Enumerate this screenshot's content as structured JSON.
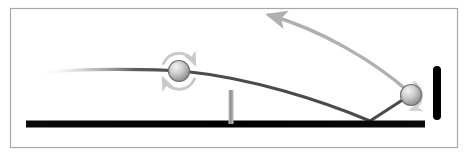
{
  "figure": {
    "canvas": {
      "width": 468,
      "height": 157
    },
    "background_color": "#ffffff"
  },
  "frame": {
    "label": "diagram border",
    "x": 10,
    "y": 8,
    "width": 448,
    "height": 140,
    "stroke_color": "#a8a8a8",
    "stroke_width": 1.2
  },
  "ground": {
    "label": "ground surface",
    "color": "#000000",
    "x1": 26,
    "x2": 425,
    "y": 124,
    "thickness": 7
  },
  "post": {
    "label": "net post",
    "color": "#9a9a9a",
    "x": 231,
    "y_top": 90,
    "y_bottom": 124,
    "thickness": 5
  },
  "wall": {
    "label": "wall paddle",
    "color": "#000000",
    "x": 437,
    "y_top": 66,
    "y_bottom": 120,
    "thickness": 8
  },
  "trajectory": {
    "label": "ball flight path",
    "color_dark": "#4b4b4b",
    "color_fade": "#ffffff",
    "stroke_width": 3.2,
    "incoming_start": {
      "x": 40,
      "y": 72
    },
    "ball_contact": {
      "x": 178,
      "y": 71
    },
    "bounce_point": {
      "x": 370,
      "y": 121
    },
    "rebound_end": {
      "x": 409,
      "y": 95
    }
  },
  "spin_arrow_curve": {
    "label": "rebound direction arrow",
    "color": "#b0b0b0",
    "stroke_width": 3.4,
    "start": {
      "x": 409,
      "y": 92
    },
    "end": {
      "x": 267,
      "y": 14
    },
    "arrowhead_at": "end"
  },
  "balls": [
    {
      "id": "ball-left",
      "label": "spinning ball in flight",
      "cx": 179,
      "cy": 71,
      "r": 10.5,
      "fill_light": "#e8e8e8",
      "fill_dark": "#8f8f8f",
      "stroke": "#6f6f6f",
      "spin_indicator": "double-arc-rotation",
      "spin_color": "#c9c9c9"
    },
    {
      "id": "ball-right",
      "label": "ball after bounce",
      "cx": 411,
      "cy": 95,
      "r": 10.5,
      "fill_light": "#e8e8e8",
      "fill_dark": "#8f8f8f",
      "stroke": "#6f6f6f",
      "spin_indicator": "single-arc-rotation",
      "spin_color": "#d2d2d2"
    }
  ]
}
